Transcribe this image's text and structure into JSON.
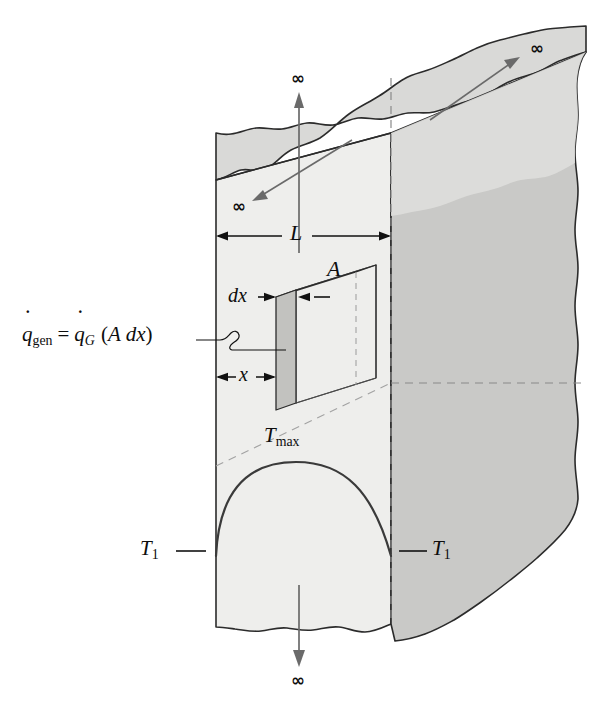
{
  "figure": {
    "type": "technical-diagram",
    "background": "#ffffff"
  },
  "colors": {
    "front_face": "#eeeeec",
    "top_face": "#d9d9d7",
    "right_face": "#c9c9c7",
    "element_face": "#c2c2bf",
    "element_top": "#e2e2e0",
    "outline": "#2b2b2b",
    "thin_line": "#5a5a5a",
    "dashed": "#8a8a8a",
    "curve": "#3a3a3a",
    "text": "#0d0d0d"
  },
  "labels": {
    "length": "L",
    "area": "A",
    "thickness": "dx",
    "position": "x",
    "t_max_base": "T",
    "t_max_sub": "max",
    "t_wall_base": "T",
    "t_wall_sub": "1",
    "t_wall_right_base": "T",
    "t_wall_right_sub": "1",
    "infinity": "∞",
    "generation": {
      "q_left_base": "q",
      "q_left_sub": "gen",
      "equals": "=",
      "q_right_base": "q",
      "q_right_sub": "G",
      "paren_open": "(",
      "area_sym": "A",
      "dx_sym": "dx",
      "paren_close": ")",
      "full_text": "q̇gen = q̇G (A dx)"
    }
  },
  "infinity_markers": [
    {
      "id": "inf-top",
      "label": "∞",
      "direction": "up",
      "x": 290,
      "y": 70
    },
    {
      "id": "inf-upright",
      "label": "∞",
      "direction": "up-right",
      "x": 538,
      "y": 48
    },
    {
      "id": "inf-left",
      "label": "∞",
      "direction": "down-left",
      "x": 236,
      "y": 205
    },
    {
      "id": "inf-bottom",
      "label": "∞",
      "direction": "down",
      "x": 290,
      "y": 680
    }
  ],
  "dimensions": [
    {
      "id": "L",
      "label": "L",
      "from_x": 216,
      "to_x": 391,
      "y": 236
    },
    {
      "id": "x",
      "label": "x",
      "from_x": 216,
      "to_x": 276,
      "y": 377
    },
    {
      "id": "dx",
      "label": "dx",
      "from_x": 276,
      "to_x": 296,
      "y": 297
    }
  ],
  "temperature_profile": {
    "shape": "parabola",
    "peak_label_base": "T",
    "peak_label_sub": "max",
    "surface_label_base": "T",
    "surface_label_sub": "1",
    "peak_x": 296,
    "peak_y": 462,
    "left_foot_x": 216,
    "right_foot_x": 391,
    "foot_y": 553
  }
}
